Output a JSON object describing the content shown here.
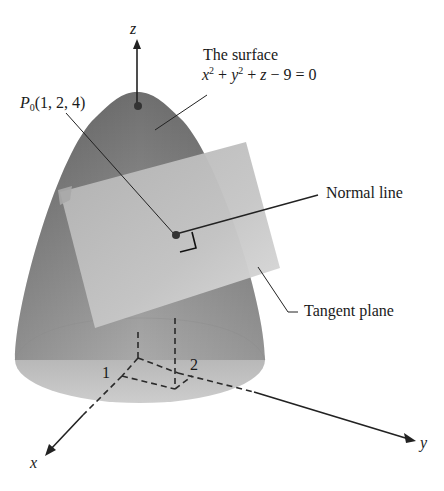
{
  "diagram": {
    "axes": {
      "x_label": "x",
      "y_label": "y",
      "z_label": "z",
      "tick_x": "1",
      "tick_y": "2"
    },
    "labels": {
      "surface_title": "The surface",
      "surface_eq_x": "x",
      "surface_eq_y": "y",
      "surface_eq_z": "z",
      "surface_eq_exp": "2",
      "surface_eq_plus1": " + ",
      "surface_eq_plus2": " + ",
      "surface_eq_rest": " − 9 = 0",
      "point_name": "P",
      "point_sub": "0",
      "point_coords": "(1, 2, 4)",
      "normal_line": "Normal line",
      "tangent_plane": "Tangent plane"
    },
    "colors": {
      "surface_dark": "#7a7a7a",
      "surface_mid": "#9a9a9a",
      "surface_base": "#b8b8b8",
      "plane_fill": "#c4c4c4",
      "plane_light": "#d8d8d8",
      "line": "#222222"
    }
  }
}
